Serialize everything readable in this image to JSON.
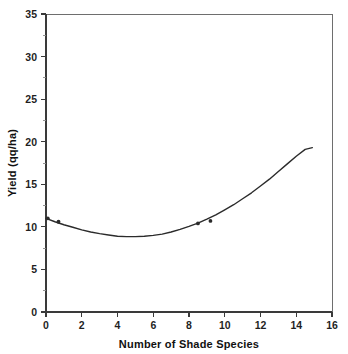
{
  "chart_data": {
    "type": "line",
    "title": "",
    "xlabel": "Number of Shade Species",
    "ylabel": "Yield (qq/ha)",
    "xlim": [
      0,
      16
    ],
    "ylim": [
      0,
      35
    ],
    "grid": false,
    "legend": "none",
    "x_ticks": [
      0,
      2,
      4,
      6,
      8,
      10,
      12,
      14,
      16
    ],
    "x_tick_labels": [
      "0",
      "2",
      "4",
      "6",
      "8",
      "10",
      "12",
      "14",
      "16"
    ],
    "x_minor_tick_step": 1,
    "y_ticks": [
      0,
      5,
      10,
      15,
      20,
      25,
      30,
      35
    ],
    "y_tick_labels": [
      "0",
      "5",
      "10",
      "15",
      "20",
      "25",
      "30",
      "35"
    ],
    "y_minor_tick_step": 2.5,
    "series": [
      {
        "name": "Yield response curve",
        "type": "line",
        "shape": "quadratic",
        "color": "#2b2b2b",
        "x": [
          0.0,
          0.5,
          1.0,
          1.5,
          2.0,
          2.5,
          3.0,
          3.5,
          4.0,
          4.5,
          5.0,
          5.5,
          6.0,
          6.5,
          7.0,
          7.5,
          8.0,
          8.5,
          9.0,
          9.5,
          10.0,
          10.5,
          11.0,
          11.5,
          12.0,
          12.5,
          13.0,
          13.5,
          14.0,
          14.5,
          14.9
        ],
        "y": [
          11.0,
          10.6,
          10.25,
          9.95,
          9.65,
          9.4,
          9.2,
          9.05,
          8.9,
          8.85,
          8.85,
          8.9,
          9.0,
          9.15,
          9.4,
          9.7,
          10.05,
          10.45,
          10.9,
          11.4,
          12.0,
          12.6,
          13.3,
          14.0,
          14.8,
          15.6,
          16.5,
          17.4,
          18.3,
          19.1,
          19.3
        ]
      },
      {
        "name": "Observed points",
        "type": "scatter",
        "color": "#2b2b2b",
        "x": [
          0.1,
          0.7,
          8.5,
          9.2
        ],
        "y": [
          11.0,
          10.6,
          10.4,
          10.7
        ]
      }
    ]
  },
  "figure": {
    "background_color": "#ffffff",
    "axis_color": "#3a3a3a",
    "frame_color": "#6e6e6e",
    "curve_color": "#2b2b2b"
  }
}
